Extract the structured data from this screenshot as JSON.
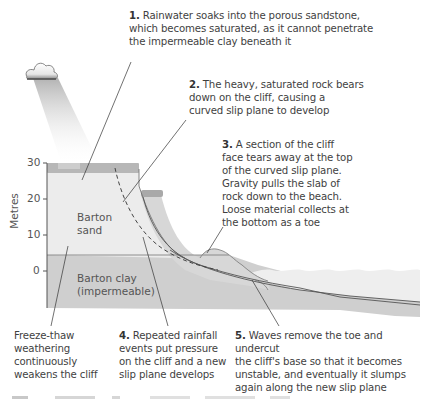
{
  "diagram": {
    "type": "cross-section",
    "y_axis": {
      "label": "Metres",
      "ticks": [
        "30",
        "20",
        "10",
        "0"
      ]
    },
    "layers": [
      {
        "name": "Barton sand",
        "line1": "Barton",
        "line2": "sand",
        "color": "#ececec"
      },
      {
        "name": "Barton clay",
        "line1": "Barton clay",
        "line2": "(impermeable)",
        "color": "#cfcfcf"
      }
    ],
    "colors": {
      "sand": "#ececec",
      "clay": "#cfcfcf",
      "cap": "#b9b9b9",
      "slump": "#d9d9d9",
      "sea": "#eeeeee",
      "line": "#4a4a4a"
    }
  },
  "annotations": {
    "a1": {
      "num": "1.",
      "lines": [
        "Rainwater soaks into the porous sandstone,",
        "which becomes saturated, as it cannot penetrate",
        "the impermeable clay beneath it"
      ]
    },
    "a2": {
      "num": "2.",
      "lines": [
        "The heavy, saturated rock bears",
        "down on the cliff, causing a",
        "curved slip plane to develop"
      ]
    },
    "a3": {
      "num": "3.",
      "lines": [
        "A section of the cliff",
        "face tears away at the top",
        "of the curved slip plane.",
        "Gravity pulls the slab of",
        "rock down to the beach.",
        "Loose material collects at",
        "the bottom as a toe"
      ]
    },
    "freeze": {
      "lines": [
        "Freeze-thaw",
        "weathering",
        "continuously",
        "weakens the cliff"
      ]
    },
    "a4": {
      "num": "4.",
      "lines": [
        "Repeated rainfall",
        "events put pressure",
        "on the cliff and a new",
        "slip plane develops"
      ]
    },
    "a5": {
      "num": "5.",
      "lines": [
        "Waves remove the toe and undercut",
        "the cliff's base so that it becomes",
        "unstable, and eventually it slumps",
        "again along the new slip plane"
      ]
    }
  }
}
